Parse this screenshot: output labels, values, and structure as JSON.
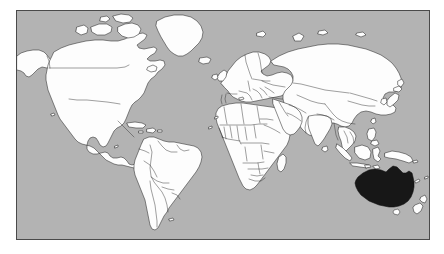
{
  "figure": {
    "type": "world-map",
    "projection": "mercator-like",
    "title": "",
    "caption": ""
  },
  "colors": {
    "ocean": "#b3b3b3",
    "land": "#fdfdfd",
    "land_outline": "#2a2a2a",
    "highlight": "#171717",
    "frame": "#4a4a4a",
    "page_background": "#ffffff"
  },
  "frame": {
    "left": 16,
    "top": 10,
    "width": 414,
    "height": 230,
    "border_width": 1
  },
  "legend": {
    "visible": false,
    "entries": [
      {
        "label": "Highlighted country",
        "color": "#171717"
      },
      {
        "label": "Other countries",
        "color": "#fdfdfd"
      },
      {
        "label": "Ocean",
        "color": "#b3b3b3"
      }
    ]
  },
  "highlighted": {
    "name": "Australia",
    "fill": "#171717",
    "continent": "Oceania"
  },
  "regions": [
    {
      "name": "North America",
      "style": "land"
    },
    {
      "name": "South America",
      "style": "land"
    },
    {
      "name": "Greenland",
      "style": "land"
    },
    {
      "name": "Europe",
      "style": "land"
    },
    {
      "name": "Africa",
      "style": "land"
    },
    {
      "name": "Asia",
      "style": "land"
    },
    {
      "name": "Australia",
      "style": "highlight"
    },
    {
      "name": "New Zealand",
      "style": "land"
    },
    {
      "name": "Indonesia",
      "style": "land"
    },
    {
      "name": "Japan",
      "style": "land"
    },
    {
      "name": "Madagascar",
      "style": "land"
    },
    {
      "name": "Iceland",
      "style": "land"
    },
    {
      "name": "United Kingdom",
      "style": "land"
    },
    {
      "name": "Sri Lanka",
      "style": "land"
    },
    {
      "name": "Tasmania",
      "style": "land"
    }
  ],
  "annotations": [],
  "axes": {
    "visible": false,
    "x_ticks": [],
    "y_ticks": []
  }
}
